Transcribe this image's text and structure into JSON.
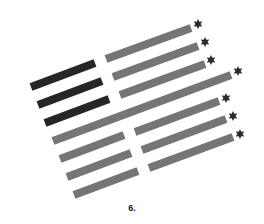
{
  "figure": {
    "caption": "6.",
    "colors": {
      "dark": "#262626",
      "gray": "#757575",
      "star": "#2b2b2b",
      "background": "#ffffff"
    },
    "bar_thickness": 8,
    "bars": [
      {
        "kind": "dark",
        "x1": 31,
        "y1": 87,
        "x2": 95,
        "y2": 63
      },
      {
        "kind": "dark",
        "x1": 38,
        "y1": 105,
        "x2": 102,
        "y2": 81
      },
      {
        "kind": "dark",
        "x1": 45,
        "y1": 123,
        "x2": 109,
        "y2": 99
      },
      {
        "kind": "gray",
        "x1": 106,
        "y1": 59,
        "x2": 191,
        "y2": 28,
        "star": true
      },
      {
        "kind": "gray",
        "x1": 113,
        "y1": 77,
        "x2": 198,
        "y2": 46,
        "star": true
      },
      {
        "kind": "gray",
        "x1": 120,
        "y1": 95,
        "x2": 205,
        "y2": 64,
        "star": true
      },
      {
        "kind": "gray",
        "x1": 53,
        "y1": 141,
        "x2": 231,
        "y2": 75,
        "star": true
      },
      {
        "kind": "gray",
        "x1": 135,
        "y1": 132,
        "x2": 219,
        "y2": 101,
        "star": true
      },
      {
        "kind": "gray",
        "x1": 142,
        "y1": 150,
        "x2": 226,
        "y2": 119,
        "star": true
      },
      {
        "kind": "gray",
        "x1": 149,
        "y1": 168,
        "x2": 233,
        "y2": 137,
        "star": true
      },
      {
        "kind": "gray",
        "x1": 60,
        "y1": 159,
        "x2": 124,
        "y2": 135
      },
      {
        "kind": "gray",
        "x1": 67,
        "y1": 177,
        "x2": 131,
        "y2": 153
      },
      {
        "kind": "gray",
        "x1": 74,
        "y1": 195,
        "x2": 138,
        "y2": 171
      }
    ],
    "stars": [
      {
        "x": 198,
        "y": 24
      },
      {
        "x": 205,
        "y": 42
      },
      {
        "x": 211,
        "y": 60
      },
      {
        "x": 238,
        "y": 71
      },
      {
        "x": 226,
        "y": 98
      },
      {
        "x": 233,
        "y": 116
      },
      {
        "x": 240,
        "y": 134
      }
    ]
  }
}
